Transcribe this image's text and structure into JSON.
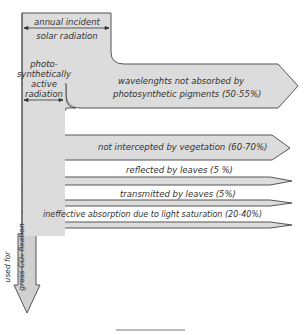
{
  "colors": {
    "fill": "#dcdcdc",
    "stroke": "#555555",
    "text": "#333333",
    "background": "#ffffff"
  },
  "incident": {
    "line1": "annual incident",
    "line2": "solar radiation"
  },
  "par": {
    "line1": "photo-",
    "line2": "synthetically",
    "line3": "active",
    "line4": "radiation"
  },
  "losses": [
    {
      "line1": "wavelenghts not absorbed by",
      "line2": "photosynthetic pigments (50-55%)"
    },
    {
      "label": "not intercepted by vegetation (60-70%)"
    },
    {
      "label": "reflected by leaves (5 %)"
    },
    {
      "label": "transmitted by leaves (5%)"
    },
    {
      "label": "ineffective absorption due to light saturation (20-40%)"
    }
  ],
  "output": {
    "line1": "used for",
    "line2": "gross CO₂ fixation"
  }
}
